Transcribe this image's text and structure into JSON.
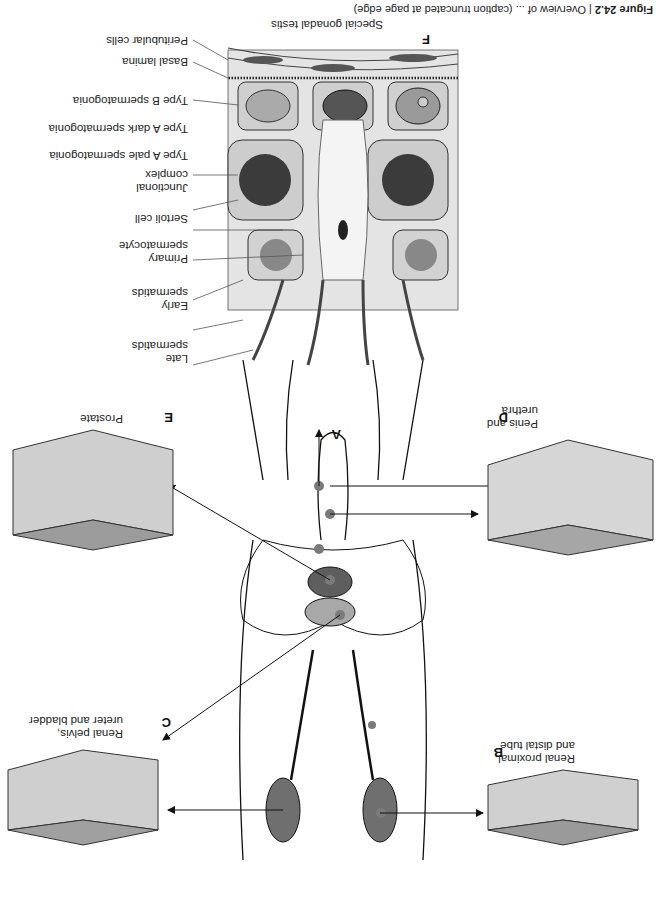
{
  "caption": {
    "prefix": "Figure 24.2",
    "text": "| Overview of ... (caption truncated at page edge)"
  },
  "panel_f": {
    "letter": "F",
    "title": "Special gonadal testis",
    "labels": [
      "Peritubular cells",
      "Basal lamina",
      "Type B spermatogonia",
      "Type A dark spermatogonia",
      "Type A pale spermatogonia",
      "Junctional complex",
      "Sertoli cell",
      "Primary spermatocyte",
      "Early spermatids",
      "Late spermatids"
    ]
  },
  "panels": {
    "a": {
      "letter": "A"
    },
    "b": {
      "letter": "B",
      "label_line1": "Renal proximal",
      "label_line2": "and distal tube"
    },
    "c": {
      "letter": "C",
      "label_line1": "Renal pelvis,",
      "label_line2": "ureter and bladder"
    },
    "d": {
      "letter": "D",
      "label_line1": "Penis and",
      "label_line2": "urethra"
    },
    "e": {
      "letter": "E",
      "label_line1": "Prostate"
    }
  },
  "colors": {
    "ink": "#111111",
    "tissue_fill": "#d9d9d9",
    "tissue_dark": "#8a8a8a",
    "kidney_fill": "#6f6f6f",
    "marker_dot": "#7a7a7a",
    "nucleus": "#3a3a3a"
  }
}
